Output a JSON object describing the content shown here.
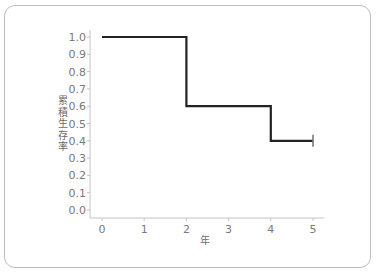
{
  "chart_data": {
    "type": "line",
    "subtype": "step (Kaplan-Meier survival curve)",
    "title": "",
    "xlabel": "年",
    "ylabel": "累積生存率",
    "x_ticks": [
      "0",
      "1",
      "2",
      "3",
      "4",
      "5"
    ],
    "y_ticks": [
      "0.0",
      "0.1",
      "0.2",
      "0.3",
      "0.4",
      "0.5",
      "0.6",
      "0.7",
      "0.8",
      "0.9",
      "1.0"
    ],
    "xlim": [
      0,
      5
    ],
    "ylim": [
      0,
      1.0
    ],
    "grid": false,
    "legend": null,
    "series": [
      {
        "name": "survival",
        "color": "#222222",
        "steps": [
          {
            "x_start": 0,
            "x_end": 2,
            "y": 1.0
          },
          {
            "x_start": 2,
            "x_end": 4,
            "y": 0.6
          },
          {
            "x_start": 4,
            "x_end": 5,
            "y": 0.4
          }
        ],
        "x": [
          0,
          2,
          2,
          4,
          4,
          5
        ],
        "y": [
          1.0,
          1.0,
          0.6,
          0.6,
          0.4,
          0.4
        ],
        "censor_marks": [
          {
            "x": 5,
            "y": 0.4
          }
        ]
      }
    ]
  },
  "colors": {
    "line": "#222222",
    "axis": "#bbbbbb",
    "tick_label": "#7a7a7a",
    "card_border": "#bdbdbd"
  }
}
